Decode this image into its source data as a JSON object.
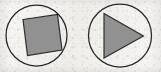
{
  "image": {
    "title": "Two circular shape icons",
    "width": 161,
    "height": 72,
    "background_color": "#f4f3f1",
    "background_description": "off-white scanned paper texture with faint speckle noise"
  },
  "palette": {
    "outline": "#262626",
    "shape_fill": "#919191",
    "shape_outline": "#2a2a2a",
    "paper": "#f4f3f1"
  },
  "icons": [
    {
      "name": "circle-with-tilted-square",
      "label": "Square in circle",
      "glyph_shape": "square",
      "rotation_degrees": -7,
      "fill": "#919191",
      "outline": "#2a2a2a",
      "circle": {
        "cx": 36.5,
        "cy": 35.5,
        "r": 30.5
      },
      "square_points": "23,19.5 57.5,14.5 62,50 27.5,55.5",
      "overflows_circle": true
    },
    {
      "name": "circle-with-play-triangle",
      "label": "Play triangle in circle",
      "glyph_shape": "triangle",
      "direction": "right",
      "fill": "#919191",
      "outline": "#2a2a2a",
      "circle": {
        "cx": 120,
        "cy": 35.5,
        "r": 31.5
      },
      "triangle_points": "104,13.5 143.5,36 104,58",
      "overflows_circle": false
    }
  ]
}
